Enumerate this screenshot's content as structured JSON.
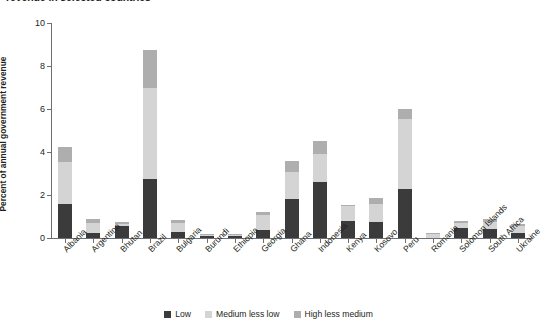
{
  "title": "revenue in selected countries",
  "chart_data": {
    "type": "bar",
    "stacked": true,
    "title": "revenue in selected countries",
    "xlabel": "",
    "ylabel": "Percent of annual government revenue",
    "ylim": [
      0,
      10
    ],
    "yticks": [
      0,
      2,
      4,
      6,
      8,
      10
    ],
    "ytick_labels": [
      "0",
      "2",
      "4",
      "6",
      "8",
      "10"
    ],
    "grid": false,
    "legend_position": "bottom",
    "categories": [
      "Albania",
      "Argentina",
      "Bhutan",
      "Brazil",
      "Bulgaria",
      "Burundi",
      "Ethiopia",
      "Georgia",
      "Ghana",
      "Indonesia",
      "Kenya",
      "Kosovo",
      "Peru",
      "Romania",
      "Solomon Islands",
      "South Africa",
      "Ukraine"
    ],
    "series": [
      {
        "name": "Low",
        "color": "#3b3b3b",
        "values": [
          1.6,
          0.25,
          0.55,
          2.75,
          0.3,
          0.1,
          0.08,
          0.35,
          1.8,
          2.6,
          0.8,
          0.75,
          2.3,
          0.0,
          0.45,
          0.4,
          0.25
        ]
      },
      {
        "name": "Medium less low",
        "color": "#d4d4d4",
        "values": [
          1.95,
          0.45,
          0.1,
          4.25,
          0.4,
          0.05,
          0.06,
          0.7,
          1.25,
          1.3,
          0.7,
          0.85,
          3.25,
          0.18,
          0.25,
          0.35,
          0.3
        ]
      },
      {
        "name": "High less medium",
        "color": "#aeaeae",
        "values": [
          0.7,
          0.2,
          0.08,
          1.75,
          0.12,
          0.03,
          0.04,
          0.15,
          0.55,
          0.6,
          0.05,
          0.25,
          0.45,
          0.04,
          0.1,
          0.15,
          0.08
        ]
      }
    ],
    "totals": [
      4.25,
      0.9,
      0.73,
      8.75,
      0.82,
      0.18,
      0.18,
      1.2,
      3.6,
      4.5,
      1.55,
      1.85,
      6.0,
      0.22,
      0.8,
      0.9,
      0.63
    ]
  },
  "legend": {
    "items": [
      {
        "label": "Low",
        "color": "#3b3b3b"
      },
      {
        "label": "Medium less low",
        "color": "#d4d4d4"
      },
      {
        "label": "High less medium",
        "color": "#aeaeae"
      }
    ]
  },
  "axis": {
    "y_title": "Percent of annual government revenue"
  }
}
